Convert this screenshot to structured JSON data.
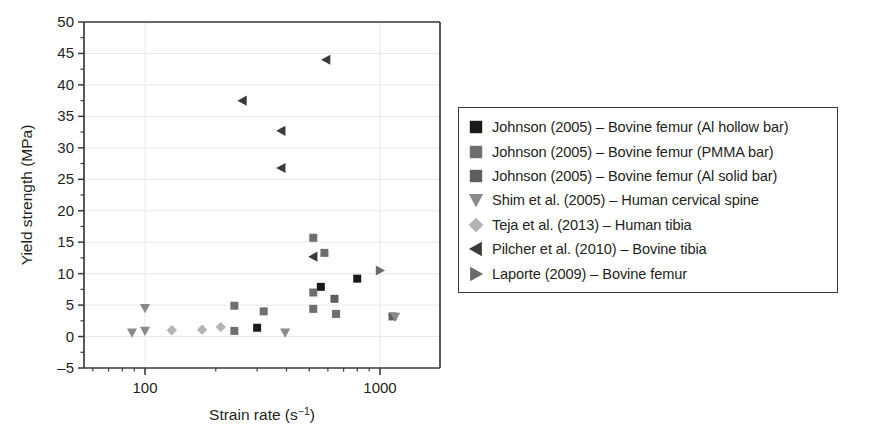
{
  "chart_data": {
    "type": "scatter",
    "title": "",
    "xlabel": "Strain rate (s⁻¹)",
    "ylabel": "Yield strength (MPa)",
    "xscale": "log",
    "xlim": [
      55,
      1800
    ],
    "ylim": [
      -5,
      50
    ],
    "yticks": [
      -5,
      0,
      5,
      10,
      15,
      20,
      25,
      30,
      35,
      40,
      45,
      50
    ],
    "ytick_labels": [
      "–5",
      "0",
      "5",
      "10",
      "15",
      "20",
      "25",
      "30",
      "35",
      "40",
      "45",
      "50"
    ],
    "xticks_major": [
      100,
      1000
    ],
    "xtick_labels": [
      "100",
      "1000"
    ],
    "grid": true,
    "grid_color": "#e8e8e8",
    "legend_position": "right-outside",
    "series": [
      {
        "name": "Johnson (2005) – Bovine femur (Al hollow bar)",
        "marker": "square",
        "color": "#1a1a1a",
        "points": [
          [
            300,
            1.4
          ],
          [
            560,
            7.9
          ],
          [
            800,
            9.2
          ]
        ]
      },
      {
        "name": "Johnson (2005) – Bovine femur (PMMA bar)",
        "marker": "square",
        "color": "#6e6e6e",
        "points": [
          [
            240,
            4.9
          ],
          [
            240,
            0.9
          ],
          [
            320,
            4.0
          ],
          [
            520,
            15.7
          ],
          [
            520,
            7.0
          ],
          [
            520,
            4.4
          ],
          [
            580,
            13.3
          ],
          [
            650,
            3.6
          ]
        ]
      },
      {
        "name": "Johnson (2005) – Bovine femur (Al solid bar)",
        "marker": "square",
        "color": "#5f5f5f",
        "points": [
          [
            640,
            6.0
          ],
          [
            1130,
            3.2
          ]
        ]
      },
      {
        "name": "Shim et al. (2005) – Human cervical spine",
        "marker": "triangle-down",
        "color": "#8a8a8a",
        "points": [
          [
            88,
            0.6
          ],
          [
            100,
            0.9
          ],
          [
            100,
            4.5
          ],
          [
            395,
            0.6
          ],
          [
            1160,
            3.1
          ]
        ]
      },
      {
        "name": "Teja et al. (2013) – Human tibia",
        "marker": "diamond",
        "color": "#b3b3b3",
        "points": [
          [
            130,
            1.0
          ],
          [
            175,
            1.1
          ],
          [
            210,
            1.5
          ]
        ]
      },
      {
        "name": "Pilcher et al. (2010) – Bovine tibia",
        "marker": "triangle-left",
        "color": "#3a3a3a",
        "points": [
          [
            260,
            37.5
          ],
          [
            380,
            32.7
          ],
          [
            380,
            26.8
          ],
          [
            590,
            44.0
          ],
          [
            520,
            12.7
          ]
        ]
      },
      {
        "name": "Laporte (2009) – Bovine femur",
        "marker": "triangle-right",
        "color": "#6b6b6b",
        "points": [
          [
            1000,
            10.5
          ]
        ]
      }
    ]
  },
  "legend": {
    "items": [
      {
        "label": "Johnson (2005) – Bovine femur (Al hollow bar)",
        "marker": "square",
        "color": "#1a1a1a"
      },
      {
        "label": "Johnson (2005) – Bovine femur (PMMA bar)",
        "marker": "square",
        "color": "#6e6e6e"
      },
      {
        "label": "Johnson (2005) – Bovine femur (Al solid bar)",
        "marker": "square",
        "color": "#5f5f5f"
      },
      {
        "label": "Shim et al. (2005) – Human cervical spine",
        "marker": "triangle-down",
        "color": "#8a8a8a"
      },
      {
        "label": "Teja et al. (2013) – Human tibia",
        "marker": "diamond",
        "color": "#b3b3b3"
      },
      {
        "label": "Pilcher et al. (2010) – Bovine tibia",
        "marker": "triangle-left",
        "color": "#3a3a3a"
      },
      {
        "label": "Laporte (2009) – Bovine femur",
        "marker": "triangle-right",
        "color": "#6b6b6b"
      }
    ]
  },
  "axis": {
    "x_title_main": "Strain rate (s",
    "x_title_sup": "−1",
    "x_title_close": ")",
    "y_title": "Yield strength (MPa)"
  }
}
